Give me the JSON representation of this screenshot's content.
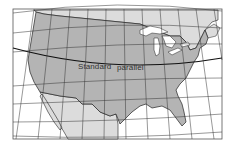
{
  "map": {
    "title": "",
    "projection": "conic",
    "region": "Contiguous United States",
    "labels": {
      "standard_parallel_word1": "Standard",
      "standard_parallel_word2": "parallel"
    },
    "colors": {
      "us_land": "#b4b4b4",
      "neighbor_land": "#dcdcdc",
      "water": "#ffffff",
      "graticule": "#333333",
      "frame": "#555555",
      "border": "#222222"
    }
  }
}
